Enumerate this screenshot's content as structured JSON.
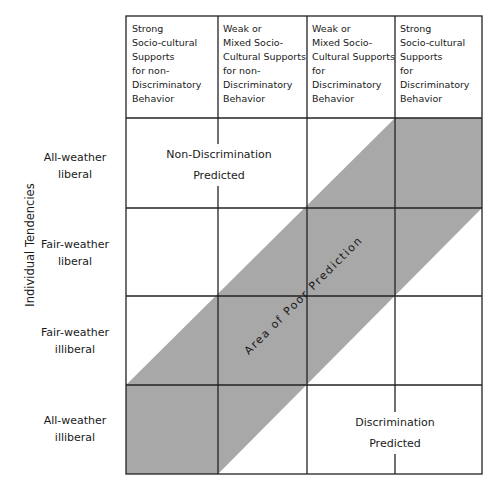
{
  "diagram": {
    "column_headers": [
      "Strong\nSocio-cultural\nSupports\nfor non-\nDiscriminatory\nBehavior",
      "Weak or\nMixed Socio-\nCultural Supports\nfor non-\nDiscriminatory\nBehavior",
      "Weak or\nMixed Socio-\nCultural Supports\nfor\nDiscriminatory\nBehavior",
      "Strong\nSocio-cultural\nSupports\nfor\nDiscriminatory\nBehavior"
    ],
    "row_axis_label": "Individual Tendencies",
    "row_labels": [
      "All-weather\nliberal",
      "Fair-weather\nliberal",
      "Fair-weather\nilliberal",
      "All-weather\nilliberal"
    ],
    "regions": {
      "top_left": "Non-Discrimination\nPredicted",
      "bottom_right": "Discrimination\nPredicted",
      "band": "Area of Poor Prediction"
    },
    "colors": {
      "band_fill": "#a8a8a8",
      "grid_line": "#222222",
      "background": "#ffffff"
    }
  }
}
